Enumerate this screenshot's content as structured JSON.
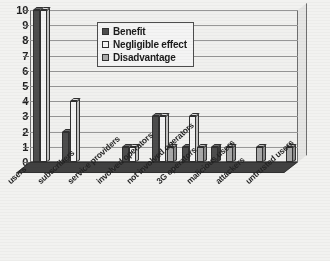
{
  "chart_data": {
    "type": "bar",
    "title": "",
    "subtitle": "",
    "xlabel": "",
    "ylabel": "",
    "ylim": [
      0,
      10
    ],
    "ytick_labels": [
      "0",
      "1",
      "2",
      "3",
      "4",
      "5",
      "6",
      "7",
      "8",
      "9",
      "10"
    ],
    "grid": true,
    "legend_position": "upper-center",
    "orientation": "vertical-grouped-3d",
    "categories": [
      "users",
      "subscribers",
      "service providers",
      "involved operators",
      "not involved operators",
      "3G operators",
      "malicious users",
      "attackers",
      "untrusted users"
    ],
    "series": [
      {
        "name": "Benefit",
        "color": "#4a4a4a",
        "values": [
          10,
          2,
          0,
          1,
          3,
          1,
          1,
          0,
          0
        ]
      },
      {
        "name": "Negligible effect",
        "color": "#ffffff",
        "values": [
          10,
          4,
          0,
          1,
          3,
          3,
          0,
          0,
          0
        ]
      },
      {
        "name": "Disadvantage",
        "color": "#b0b0b0",
        "values": [
          0,
          0,
          0,
          0,
          1,
          1,
          1,
          1,
          1
        ]
      }
    ]
  },
  "legend": {
    "items": [
      {
        "label": "Benefit"
      },
      {
        "label": "Negligible effect"
      },
      {
        "label": "Disadvantage"
      }
    ]
  }
}
